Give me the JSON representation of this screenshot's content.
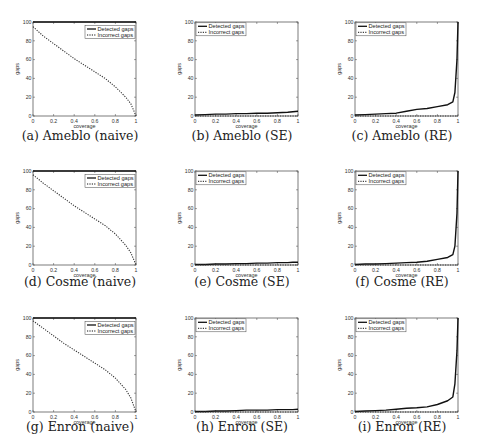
{
  "figure": {
    "panels": [
      {
        "id": "a",
        "caption": "(a) Ameblo (naive)",
        "dataset": "Ameblo",
        "method": "naive"
      },
      {
        "id": "b",
        "caption": "(b) Ameblo (SE)",
        "dataset": "Ameblo",
        "method": "SE"
      },
      {
        "id": "c",
        "caption": "(c) Ameblo (RE)",
        "dataset": "Ameblo",
        "method": "RE"
      },
      {
        "id": "d",
        "caption": "(d) Cosme (naive)",
        "dataset": "Cosme",
        "method": "naive"
      },
      {
        "id": "e",
        "caption": "(e) Cosme (SE)",
        "dataset": "Cosme",
        "method": "SE"
      },
      {
        "id": "f",
        "caption": "(f) Cosme (RE)",
        "dataset": "Cosme",
        "method": "RE"
      },
      {
        "id": "g",
        "caption": "(g) Enron (naive)",
        "dataset": "Enron",
        "method": "naive"
      },
      {
        "id": "h",
        "caption": "(h) Enron (SE)",
        "dataset": "Enron",
        "method": "SE"
      },
      {
        "id": "i",
        "caption": "(i) Enron (RE)",
        "dataset": "Enron",
        "method": "RE"
      }
    ],
    "xlabel": "coverage",
    "ylabel": "gaps",
    "legend": [
      "Detected gaps",
      "Incorrect gaps"
    ],
    "xticks": [
      "0",
      "0.2",
      "0.4",
      "0.6",
      "0.8",
      "1"
    ],
    "yticks": [
      "0",
      "20",
      "40",
      "60",
      "80",
      "100"
    ]
  },
  "chart_data": [
    {
      "type": "line",
      "title": "(a) Ameblo (naive)",
      "xlabel": "coverage",
      "ylabel": "gaps",
      "xlim": [
        0,
        1
      ],
      "ylim": [
        0,
        100
      ],
      "grid": false,
      "legend_position": "upper right",
      "x": [
        0,
        0.1,
        0.2,
        0.3,
        0.4,
        0.5,
        0.6,
        0.7,
        0.8,
        0.9,
        0.95,
        1.0
      ],
      "series": [
        {
          "name": "Detected gaps",
          "style": "solid",
          "values": [
            100,
            100,
            100,
            100,
            100,
            100,
            100,
            100,
            100,
            100,
            100,
            100
          ]
        },
        {
          "name": "Incorrect gaps",
          "style": "dotted",
          "values": [
            95,
            85,
            77,
            69,
            61,
            54,
            47,
            40,
            31,
            20,
            13,
            0
          ]
        }
      ]
    },
    {
      "type": "line",
      "title": "(b) Ameblo (SE)",
      "xlabel": "coverage",
      "ylabel": "gaps",
      "xlim": [
        0,
        1
      ],
      "ylim": [
        0,
        100
      ],
      "grid": false,
      "legend_position": "upper left",
      "x": [
        0,
        0.1,
        0.2,
        0.3,
        0.4,
        0.5,
        0.6,
        0.7,
        0.8,
        0.9,
        0.95,
        1.0
      ],
      "series": [
        {
          "name": "Detected gaps",
          "style": "solid",
          "values": [
            1,
            1.5,
            2,
            2,
            2.5,
            2.5,
            3,
            3,
            3.5,
            4,
            4.5,
            5
          ]
        },
        {
          "name": "Incorrect gaps",
          "style": "dotted",
          "values": [
            0,
            0,
            0,
            0,
            0,
            0,
            0,
            0,
            0,
            0,
            0,
            0
          ]
        }
      ]
    },
    {
      "type": "line",
      "title": "(c) Ameblo (RE)",
      "xlabel": "coverage",
      "ylabel": "gaps",
      "xlim": [
        0,
        1
      ],
      "ylim": [
        0,
        100
      ],
      "grid": false,
      "legend_position": "upper left",
      "x": [
        0,
        0.1,
        0.2,
        0.3,
        0.4,
        0.5,
        0.6,
        0.7,
        0.8,
        0.9,
        0.95,
        0.97,
        0.99,
        1.0
      ],
      "series": [
        {
          "name": "Detected gaps",
          "style": "solid",
          "values": [
            1,
            1.5,
            2,
            2.5,
            3,
            5,
            7,
            8,
            10,
            12,
            15,
            25,
            60,
            100
          ]
        },
        {
          "name": "Incorrect gaps",
          "style": "dotted",
          "values": [
            0,
            0,
            0,
            0,
            0,
            0,
            0,
            0,
            0,
            0,
            0,
            0,
            0,
            0
          ]
        }
      ]
    },
    {
      "type": "line",
      "title": "(d) Cosme (naive)",
      "xlabel": "coverage",
      "ylabel": "gaps",
      "xlim": [
        0,
        1
      ],
      "ylim": [
        0,
        100
      ],
      "grid": false,
      "legend_position": "upper right",
      "x": [
        0,
        0.1,
        0.2,
        0.3,
        0.4,
        0.5,
        0.6,
        0.7,
        0.8,
        0.9,
        0.95,
        1.0
      ],
      "series": [
        {
          "name": "Detected gaps",
          "style": "solid",
          "values": [
            100,
            100,
            100,
            100,
            100,
            100,
            100,
            100,
            100,
            100,
            100,
            100
          ]
        },
        {
          "name": "Incorrect gaps",
          "style": "dotted",
          "values": [
            96,
            87,
            79,
            71,
            63,
            56,
            49,
            42,
            33,
            21,
            13,
            0
          ]
        }
      ]
    },
    {
      "type": "line",
      "title": "(e) Cosme (SE)",
      "xlabel": "coverage",
      "ylabel": "gaps",
      "xlim": [
        0,
        1
      ],
      "ylim": [
        0,
        100
      ],
      "grid": false,
      "legend_position": "upper left",
      "x": [
        0,
        0.1,
        0.2,
        0.3,
        0.4,
        0.5,
        0.6,
        0.7,
        0.8,
        0.9,
        0.95,
        1.0
      ],
      "series": [
        {
          "name": "Detected gaps",
          "style": "solid",
          "values": [
            0.5,
            0.5,
            1,
            1,
            1.5,
            1.5,
            2,
            2,
            2.5,
            2.5,
            3,
            3
          ]
        },
        {
          "name": "Incorrect gaps",
          "style": "dotted",
          "values": [
            0,
            0,
            0,
            0,
            0,
            0,
            0,
            0,
            0,
            0,
            0,
            0
          ]
        }
      ]
    },
    {
      "type": "line",
      "title": "(f) Cosme (RE)",
      "xlabel": "coverage",
      "ylabel": "gaps",
      "xlim": [
        0,
        1
      ],
      "ylim": [
        0,
        100
      ],
      "grid": false,
      "legend_position": "upper left",
      "x": [
        0,
        0.1,
        0.2,
        0.3,
        0.4,
        0.5,
        0.6,
        0.7,
        0.8,
        0.9,
        0.95,
        0.97,
        0.99,
        1.0
      ],
      "series": [
        {
          "name": "Detected gaps",
          "style": "solid",
          "values": [
            0.5,
            1,
            1,
            1.5,
            2,
            2.5,
            3,
            4,
            6,
            8,
            11,
            20,
            55,
            100
          ]
        },
        {
          "name": "Incorrect gaps",
          "style": "dotted",
          "values": [
            0,
            0,
            0,
            0,
            0,
            0,
            0,
            0,
            0,
            0,
            0,
            0,
            0,
            0
          ]
        }
      ]
    },
    {
      "type": "line",
      "title": "(g) Enron (naive)",
      "xlabel": "coverage",
      "ylabel": "gaps",
      "xlim": [
        0,
        1
      ],
      "ylim": [
        0,
        100
      ],
      "grid": false,
      "legend_position": "upper right",
      "x": [
        0,
        0.1,
        0.2,
        0.3,
        0.4,
        0.5,
        0.6,
        0.7,
        0.8,
        0.9,
        0.95,
        1.0
      ],
      "series": [
        {
          "name": "Detected gaps",
          "style": "solid",
          "values": [
            100,
            100,
            100,
            100,
            100,
            100,
            100,
            100,
            100,
            100,
            100,
            100
          ]
        },
        {
          "name": "Incorrect gaps",
          "style": "dotted",
          "values": [
            97,
            89,
            81,
            73,
            66,
            59,
            52,
            45,
            36,
            24,
            15,
            0
          ]
        }
      ]
    },
    {
      "type": "line",
      "title": "(h) Enron (SE)",
      "xlabel": "coverage",
      "ylabel": "gaps",
      "xlim": [
        0,
        1
      ],
      "ylim": [
        0,
        100
      ],
      "grid": false,
      "legend_position": "upper left",
      "x": [
        0,
        0.1,
        0.2,
        0.3,
        0.4,
        0.5,
        0.6,
        0.7,
        0.8,
        0.9,
        0.95,
        1.0
      ],
      "series": [
        {
          "name": "Detected gaps",
          "style": "solid",
          "values": [
            0.5,
            0.5,
            1,
            1,
            1.5,
            2,
            2,
            2,
            2.5,
            2.5,
            2.5,
            3
          ]
        },
        {
          "name": "Incorrect gaps",
          "style": "dotted",
          "values": [
            0,
            0,
            0,
            0,
            0,
            0,
            0,
            0,
            0,
            0,
            0,
            0
          ]
        }
      ]
    },
    {
      "type": "line",
      "title": "(i) Enron (RE)",
      "xlabel": "coverage",
      "ylabel": "gaps",
      "xlim": [
        0,
        1
      ],
      "ylim": [
        0,
        100
      ],
      "grid": false,
      "legend_position": "upper left",
      "x": [
        0,
        0.1,
        0.2,
        0.3,
        0.4,
        0.5,
        0.6,
        0.7,
        0.8,
        0.9,
        0.95,
        0.97,
        0.99,
        1.0
      ],
      "series": [
        {
          "name": "Detected gaps",
          "style": "solid",
          "values": [
            0.5,
            1,
            1.5,
            2,
            3,
            4,
            4.5,
            5.5,
            8,
            12,
            16,
            30,
            65,
            100
          ]
        },
        {
          "name": "Incorrect gaps",
          "style": "dotted",
          "values": [
            0,
            0,
            0,
            0,
            0,
            0,
            0,
            0,
            0,
            0,
            0,
            0,
            0,
            0
          ]
        }
      ]
    }
  ]
}
